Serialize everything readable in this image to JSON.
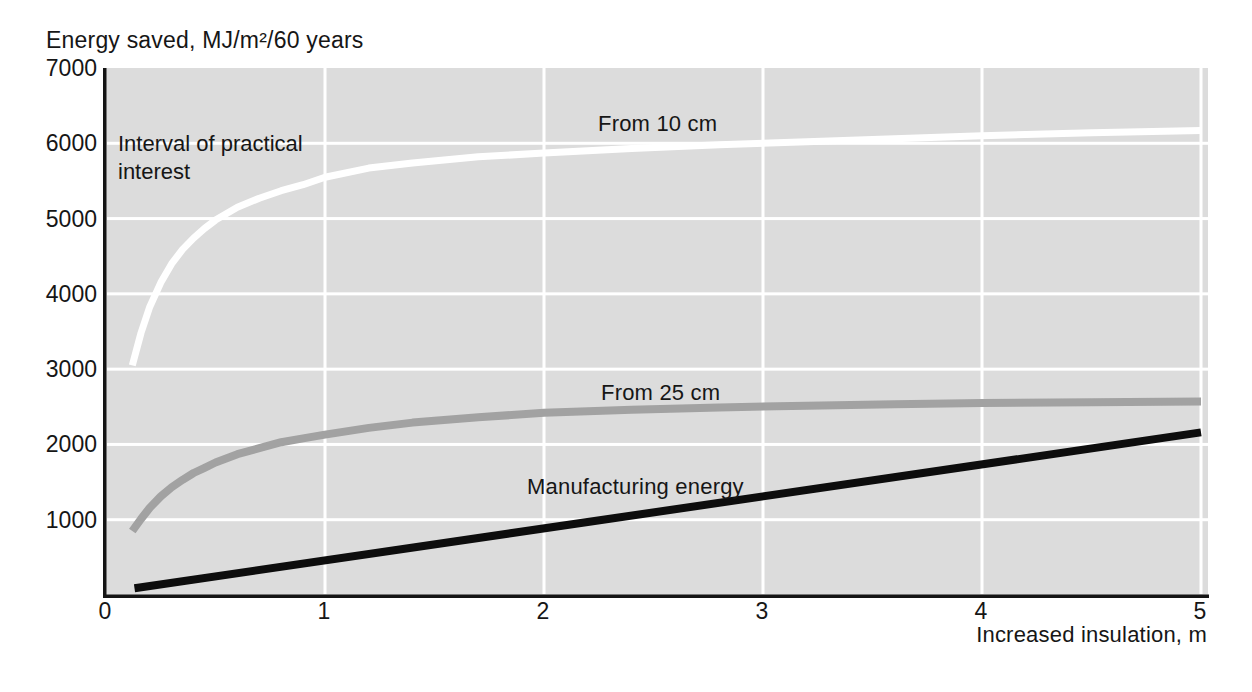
{
  "chart_data": {
    "type": "line",
    "title": "Energy saved, MJ/m²/60 years",
    "xlabel": "Increased insulation, m",
    "ylabel": "Energy saved, MJ/m²/60 years",
    "xlim": [
      0,
      5
    ],
    "ylim": [
      0,
      7000
    ],
    "xticks": [
      0,
      1,
      2,
      3,
      4,
      5
    ],
    "yticks": [
      1000,
      2000,
      3000,
      4000,
      5000,
      6000,
      7000
    ],
    "grid": true,
    "legend_position": "inline-labels",
    "plot_bg_color": "#dcdcdc",
    "gridline_color": "#ffffff",
    "axis_color": "#141414",
    "annotation": "Interval of practical\ninterest",
    "series": [
      {
        "name": "From 10 cm",
        "color": "#ffffff",
        "width": 7,
        "x": [
          0.12,
          0.16,
          0.2,
          0.25,
          0.3,
          0.35,
          0.4,
          0.45,
          0.5,
          0.6,
          0.7,
          0.8,
          0.9,
          1.0,
          1.2,
          1.4,
          1.7,
          2.0,
          2.4,
          2.8,
          3.2,
          3.6,
          4.0,
          4.5,
          5.0
        ],
        "y": [
          3050,
          3480,
          3830,
          4150,
          4400,
          4590,
          4740,
          4870,
          4980,
          5150,
          5270,
          5370,
          5450,
          5550,
          5670,
          5740,
          5820,
          5870,
          5930,
          5980,
          6020,
          6060,
          6100,
          6140,
          6170
        ]
      },
      {
        "name": "From 25 cm",
        "color": "#a2a2a2",
        "width": 8,
        "x": [
          0.12,
          0.16,
          0.2,
          0.25,
          0.3,
          0.35,
          0.4,
          0.45,
          0.5,
          0.6,
          0.7,
          0.8,
          0.9,
          1.0,
          1.2,
          1.4,
          1.7,
          2.0,
          2.4,
          2.8,
          3.2,
          3.6,
          4.0,
          4.5,
          5.0
        ],
        "y": [
          850,
          1010,
          1160,
          1310,
          1430,
          1530,
          1620,
          1690,
          1760,
          1870,
          1950,
          2030,
          2080,
          2130,
          2220,
          2290,
          2360,
          2420,
          2460,
          2490,
          2515,
          2535,
          2550,
          2560,
          2570
        ]
      },
      {
        "name": "Manufacturing energy",
        "color": "#0d0d0d",
        "width": 8,
        "x": [
          0.13,
          5.0
        ],
        "y": [
          90,
          2160
        ]
      }
    ]
  }
}
